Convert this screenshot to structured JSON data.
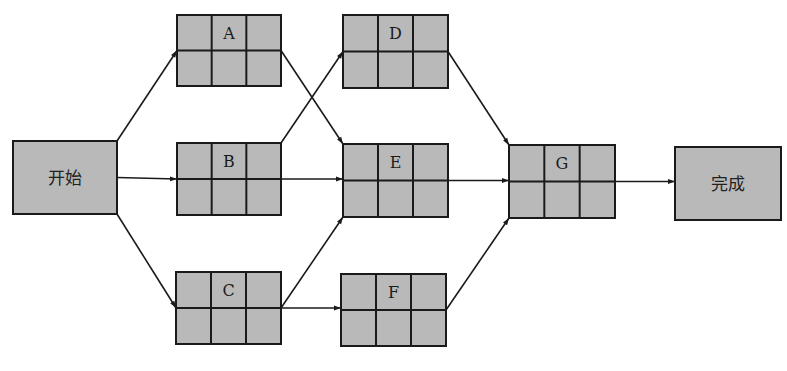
{
  "diagram": {
    "type": "activity-on-node network",
    "fill_color": "#b9b9b9",
    "stroke_color": "#1a1a1a",
    "terminals": {
      "start": {
        "label": "开始",
        "x": 13,
        "y": 141,
        "w": 104,
        "h": 73
      },
      "end": {
        "label": "完成",
        "x": 675,
        "y": 147,
        "w": 106,
        "h": 73
      }
    },
    "nodes": [
      {
        "id": "A",
        "label": "A",
        "x": 177,
        "y": 15,
        "w": 104,
        "h": 71
      },
      {
        "id": "B",
        "label": "B",
        "x": 177,
        "y": 143,
        "w": 104,
        "h": 72
      },
      {
        "id": "C",
        "label": "C",
        "x": 176,
        "y": 272,
        "w": 105,
        "h": 72
      },
      {
        "id": "D",
        "label": "D",
        "x": 343,
        "y": 15,
        "w": 105,
        "h": 73
      },
      {
        "id": "E",
        "label": "E",
        "x": 343,
        "y": 144,
        "w": 105,
        "h": 73
      },
      {
        "id": "F",
        "label": "F",
        "x": 341,
        "y": 274,
        "w": 105,
        "h": 72
      },
      {
        "id": "G",
        "label": "G",
        "x": 509,
        "y": 145,
        "w": 106,
        "h": 73
      }
    ],
    "edges": [
      {
        "from": "start",
        "to": "A"
      },
      {
        "from": "start",
        "to": "B"
      },
      {
        "from": "start",
        "to": "C"
      },
      {
        "from": "A",
        "to": "E"
      },
      {
        "from": "B",
        "to": "D"
      },
      {
        "from": "B",
        "to": "E"
      },
      {
        "from": "C",
        "to": "E"
      },
      {
        "from": "C",
        "to": "F"
      },
      {
        "from": "D",
        "to": "G"
      },
      {
        "from": "E",
        "to": "G"
      },
      {
        "from": "F",
        "to": "G"
      },
      {
        "from": "G",
        "to": "end"
      }
    ]
  }
}
